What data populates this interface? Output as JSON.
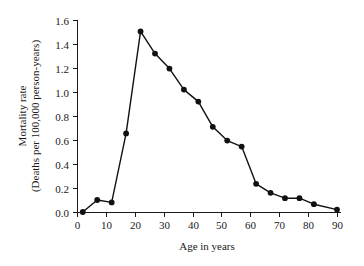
{
  "chart_data": {
    "type": "line",
    "title": "",
    "xlabel": "Age in years",
    "ylabel_line1": "Mortality rate",
    "ylabel_line2": "(Deaths per 100,000 person-years)",
    "xlim": [
      0,
      90
    ],
    "ylim": [
      0.0,
      1.6
    ],
    "xticks": [
      0,
      10,
      20,
      30,
      40,
      50,
      60,
      70,
      80,
      90
    ],
    "xtick_labels": [
      "0",
      "10",
      "20",
      "30",
      "40",
      "50",
      "60",
      "70",
      "80",
      "90"
    ],
    "yticks": [
      0.0,
      0.2,
      0.4,
      0.6,
      0.8,
      1.0,
      1.2,
      1.4,
      1.6
    ],
    "ytick_labels": [
      "0.0",
      "0.2",
      "0.4",
      "0.6",
      "0.8",
      "1.0",
      "1.2",
      "1.4",
      "1.6"
    ],
    "grid": false,
    "legend": false,
    "marker": "filled-circle",
    "marker_color": "#111111",
    "line_color": "#111111",
    "x": [
      2,
      7,
      12,
      17,
      22,
      27,
      32,
      37,
      42,
      47,
      52,
      57,
      62,
      67,
      72,
      77,
      82,
      90
    ],
    "values": [
      0.0,
      0.1,
      0.08,
      0.655,
      1.505,
      1.32,
      1.195,
      1.02,
      0.92,
      0.71,
      0.595,
      0.545,
      0.235,
      0.16,
      0.115,
      0.115,
      0.065,
      0.02
    ],
    "series": [
      {
        "name": "Mortality rate",
        "values": [
          0.0,
          0.1,
          0.08,
          0.655,
          1.505,
          1.32,
          1.195,
          1.02,
          0.92,
          0.71,
          0.595,
          0.545,
          0.235,
          0.16,
          0.115,
          0.115,
          0.065,
          0.02
        ]
      }
    ]
  },
  "geometry": {
    "plot_left": 77,
    "plot_right": 337,
    "plot_top": 20,
    "plot_bottom": 212
  }
}
